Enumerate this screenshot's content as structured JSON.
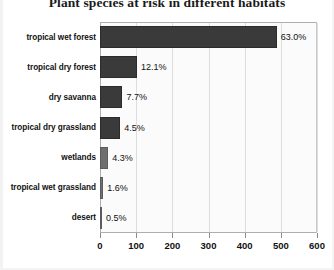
{
  "chart_data": {
    "type": "bar",
    "orientation": "horizontal",
    "title": "Plant species at risk in different habitats",
    "xlabel": "",
    "ylabel": "",
    "xlim": [
      0,
      600
    ],
    "xticks": [
      0,
      100,
      200,
      300,
      400,
      500,
      600
    ],
    "grid": true,
    "legend": null,
    "categories": [
      "tropical wet forest",
      "tropical dry forest",
      "dry savanna",
      "tropical dry grassland",
      "wetlands",
      "tropical wet grassland",
      "desert"
    ],
    "values": [
      489,
      102,
      62,
      56,
      23,
      9,
      3
    ],
    "data_labels": [
      "63.0%",
      "12.1%",
      "7.7%",
      "4.5%",
      "4.3%",
      "1.6%",
      "0.5%"
    ],
    "bars": [
      {
        "category": "tropical wet forest",
        "value": 489,
        "label": "63.0%",
        "shade": "dark"
      },
      {
        "category": "tropical dry forest",
        "value": 102,
        "label": "12.1%",
        "shade": "dark"
      },
      {
        "category": "dry savanna",
        "value": 62,
        "label": "7.7%",
        "shade": "dark"
      },
      {
        "category": "tropical dry grassland",
        "value": 56,
        "label": "4.5%",
        "shade": "dark"
      },
      {
        "category": "wetlands",
        "value": 23,
        "label": "4.3%",
        "shade": "light"
      },
      {
        "category": "tropical wet grassland",
        "value": 9,
        "label": "1.6%",
        "shade": "light"
      },
      {
        "category": "desert",
        "value": 3,
        "label": "0.5%",
        "shade": "light"
      }
    ],
    "colors": {
      "bar_dark": "#3a3a3a",
      "bar_light": "#6f6f6f",
      "plot_background": "#fbfbfb",
      "gridline": "#dedede",
      "axis": "#8a8a8a",
      "text": "#111111"
    }
  }
}
